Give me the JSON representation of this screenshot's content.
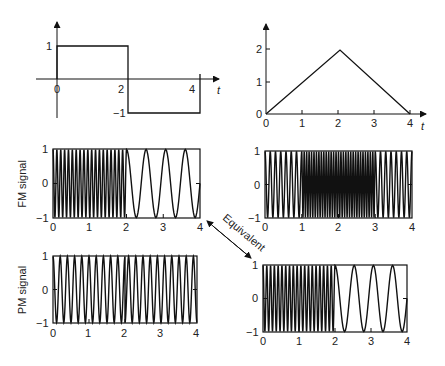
{
  "chart_data": [
    {
      "id": "message-square",
      "type": "line",
      "title": "",
      "x": [
        0,
        2,
        2,
        4
      ],
      "values": [
        1,
        1,
        -1,
        -1
      ],
      "xlabel": "t",
      "ylabel": "",
      "xticks": [
        "0",
        "2",
        "4"
      ],
      "yticks": [
        "1",
        "-1"
      ],
      "xlim": [
        0,
        4
      ],
      "ylim": [
        -1,
        1
      ]
    },
    {
      "id": "message-triangle",
      "type": "line",
      "title": "",
      "x": [
        0,
        1,
        2,
        3,
        4
      ],
      "values": [
        0,
        1,
        2,
        1,
        0
      ],
      "xlabel": "t",
      "ylabel": "",
      "xticks": [
        "0",
        "1",
        "2",
        "3",
        "4"
      ],
      "yticks": [
        "0",
        "1",
        "2"
      ],
      "xlim": [
        0,
        4
      ],
      "ylim": [
        0,
        2
      ]
    },
    {
      "id": "fm-of-square",
      "type": "line",
      "title": "",
      "ylabel": "FM signal",
      "xlabel": "",
      "xticks": [
        "0",
        "1",
        "2",
        "3",
        "4"
      ],
      "yticks": [
        "1",
        "0",
        "-1"
      ],
      "xlim": [
        0,
        4
      ],
      "ylim": [
        -1,
        1
      ],
      "description": "High-frequency sinusoid for 0<t<2, low-frequency (about 4 cycles over 2..4) for 2<t<4",
      "segments": [
        {
          "t_start": 0,
          "t_end": 2,
          "approx_cycles": 19
        },
        {
          "t_start": 2,
          "t_end": 4,
          "approx_cycles": 3.75
        }
      ]
    },
    {
      "id": "fm-of-triangle",
      "type": "line",
      "title": "",
      "ylabel": "",
      "xlabel": "",
      "xticks": [
        "0",
        "1",
        "2",
        "3",
        "4"
      ],
      "yticks": [
        "1",
        "0",
        "-1"
      ],
      "xlim": [
        0,
        4
      ],
      "ylim": [
        -1,
        1
      ],
      "description": "Chirped sinusoid: frequency rising from 0 to 1, very dense 1 to 3, decreasing 3 to 4",
      "segments": [
        {
          "t_start": 0,
          "t_end": 1,
          "approx_cycles": 7
        },
        {
          "t_start": 1,
          "t_end": 3,
          "approx_cycles": 30
        },
        {
          "t_start": 3,
          "t_end": 4,
          "approx_cycles": 7
        }
      ]
    },
    {
      "id": "pm-of-square",
      "type": "line",
      "title": "",
      "ylabel": "PM signal",
      "xlabel": "",
      "xticks": [
        "0",
        "1",
        "2",
        "3",
        "4"
      ],
      "yticks": [
        "1",
        "0",
        "-1"
      ],
      "xlim": [
        0,
        4
      ],
      "ylim": [
        -1,
        1
      ],
      "description": "Constant-frequency sinusoid with a phase jump at t=2",
      "segments": [
        {
          "t_start": 0,
          "t_end": 2,
          "approx_cycles": 10
        },
        {
          "t_start": 2,
          "t_end": 4,
          "approx_cycles": 10
        }
      ]
    },
    {
      "id": "pm-of-triangle",
      "type": "line",
      "title": "",
      "ylabel": "",
      "xlabel": "",
      "xticks": [
        "0",
        "1",
        "2",
        "3",
        "4"
      ],
      "yticks": [
        "1",
        "0",
        "-1"
      ],
      "xlim": [
        0,
        4
      ],
      "ylim": [
        -1,
        1
      ],
      "description": "Equivalent to FM of square wave: high frequency 0..2, low frequency 2..4",
      "segments": [
        {
          "t_start": 0,
          "t_end": 2,
          "approx_cycles": 19
        },
        {
          "t_start": 2,
          "t_end": 4,
          "approx_cycles": 3.75
        }
      ]
    }
  ],
  "labels": {
    "fm_signal": "FM signal",
    "pm_signal": "PM signal",
    "equivalent": "Equivalent",
    "t": "t"
  },
  "ticks": {
    "zero": "0",
    "one": "1",
    "two": "2",
    "three": "3",
    "four": "4",
    "minus_one": "−1"
  },
  "colors": {
    "ink": "#111111",
    "background": "#ffffff"
  }
}
